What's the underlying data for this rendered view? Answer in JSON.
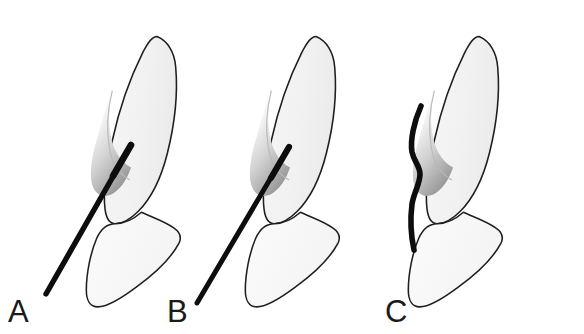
{
  "figure": {
    "background_color": "#ffffff",
    "outline_color": "#1a1a1a",
    "tooth_fill_color": "#f2f2f2",
    "gingiva_shade_color": "#9a9a9a",
    "needle_color": "#0d0d0d",
    "panel_count": 3
  },
  "panels": [
    {
      "id": "A",
      "label": "A",
      "label_x": 8,
      "label_y": 322,
      "needle_style": "straight-steep",
      "needle_description": "Straight needle angled steeply, tip entering gingival sulcus from below-left",
      "needle_tip": [
        130,
        146
      ],
      "needle_end": [
        45,
        294
      ],
      "needle_width": 5.4,
      "tooth_offset_x": 0
    },
    {
      "id": "B",
      "label": "B",
      "label_x": 167,
      "label_y": 322,
      "needle_style": "straight-shallow",
      "needle_description": "Straight needle at a shallower angle, tip at the gingival margin",
      "needle_tip": [
        288,
        147
      ],
      "needle_end": [
        196,
        302
      ],
      "needle_width": 5.0,
      "tooth_offset_x": 163
    },
    {
      "id": "C",
      "label": "C",
      "label_x": 385,
      "label_y": 322,
      "needle_style": "curved-bent",
      "needle_description": "Pre-bent needle running nearly vertically along the tooth surface with a step bend at the sulcus",
      "needle_tip": [
        417,
        108
      ],
      "needle_end": [
        415,
        249
      ],
      "needle_width": 5.6,
      "tooth_offset_x": 326
    }
  ],
  "tooth_parts": [
    {
      "name": "crown",
      "label": "crown"
    },
    {
      "name": "root",
      "label": "root"
    },
    {
      "name": "gingiva",
      "label": "gingiva"
    },
    {
      "name": "gingival-sulcus",
      "label": "gingival sulcus"
    },
    {
      "name": "cementoenamel-junction",
      "label": "cementoenamel junction"
    }
  ]
}
